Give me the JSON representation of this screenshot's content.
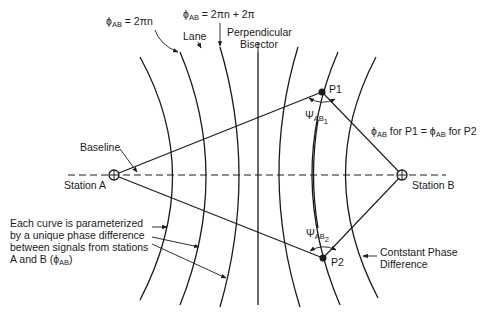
{
  "figure": {
    "type": "hyperbolic-navigation-lanes",
    "stations": [
      {
        "id": "A",
        "label": "Station A"
      },
      {
        "id": "B",
        "label": "Station B"
      }
    ],
    "points": [
      {
        "id": "P1",
        "label": "P1"
      },
      {
        "id": "P2",
        "label": "P2"
      }
    ],
    "labels": {
      "phi_n": {
        "main": "ϕ",
        "sub": "AB",
        "rest": " = 2πn"
      },
      "phi_n_plus": {
        "main": "ϕ",
        "sub": "AB",
        "rest": " = 2πn + 2π"
      },
      "lane": "Lane",
      "bisector_line1": "Perpendicular",
      "bisector_line2": "Bisector",
      "baseline": "Baseline",
      "psi1": {
        "main": "Ψ",
        "sub": "AB",
        "subsub": "1"
      },
      "psi2": {
        "main": "Ψ",
        "sub": "AB",
        "subsub": "2"
      },
      "equality": {
        "phi": "ϕ",
        "sub": "AB",
        "text1": " for P1 = ",
        "phi2": "ϕ",
        "sub2": "AB",
        "text2": " for P2"
      },
      "constant_phase_line1": "Contstant Phase",
      "constant_phase_line2": "Difference",
      "note_lines": [
        "Each curve is parameterized",
        "by a unique phase difference",
        "between signals from stations",
        "A and B ("
      ],
      "note_phi": "ϕ",
      "note_sub": "AB",
      "note_close": ")"
    },
    "curves_count": 7,
    "stroke_color": "#1a1a1a",
    "background": "#ffffff"
  }
}
